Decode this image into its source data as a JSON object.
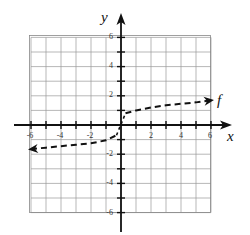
{
  "chart_data": {
    "type": "line",
    "title": "",
    "xlabel": "x",
    "ylabel": "y",
    "xlim": [
      -6,
      6
    ],
    "ylim": [
      -6,
      6
    ],
    "grid": true,
    "x_ticks": [
      -6,
      -4,
      -2,
      2,
      4,
      6
    ],
    "y_ticks": [
      6,
      4,
      2,
      -2,
      -4,
      -6
    ],
    "x_tick_labels": [
      "-6",
      "-4",
      "-2",
      "2",
      "4",
      "6"
    ],
    "y_tick_labels": [
      "6",
      "4",
      "2",
      "-2",
      "-4",
      "-6"
    ],
    "series": [
      {
        "name": "f",
        "style": "dashed",
        "arrows": "both",
        "x": [
          -6,
          -5,
          -4,
          -3,
          -2,
          -1,
          -0.3,
          0,
          0.3,
          1,
          2,
          3,
          4,
          5,
          6
        ],
        "y": [
          -1.65,
          -1.55,
          -1.45,
          -1.35,
          -1.25,
          -1.05,
          -0.7,
          0.4,
          0.8,
          1.0,
          1.2,
          1.35,
          1.45,
          1.55,
          1.7
        ]
      }
    ],
    "annotations": [
      {
        "text": "f",
        "x": 6.7,
        "y": 1.7
      }
    ]
  },
  "labels": {
    "x_axis": "x",
    "y_axis": "y",
    "curve": "f",
    "xt0": "-6",
    "xt1": "-4",
    "xt2": "-2",
    "xt3": "2",
    "xt4": "4",
    "xt5": "6",
    "yt0": "6",
    "yt1": "4",
    "yt2": "2",
    "yt3": "-2",
    "yt4": "-4",
    "yt5": "-6"
  }
}
